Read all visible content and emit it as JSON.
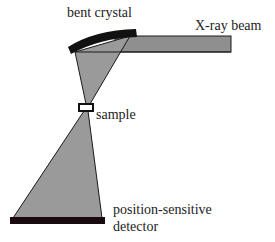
{
  "labels": {
    "crystal": "bent crystal",
    "beam": "X-ray beam",
    "sample": "sample",
    "detector_line1": "position-sensitive",
    "detector_line2": "detector"
  },
  "colors": {
    "cone_fill": "#9a9a9a",
    "beam_fill": "#8f8f8f",
    "outline": "#1a1a1a",
    "crystal": "#111111",
    "detector": "#1a0a10",
    "sample_box": "#ffffff"
  }
}
